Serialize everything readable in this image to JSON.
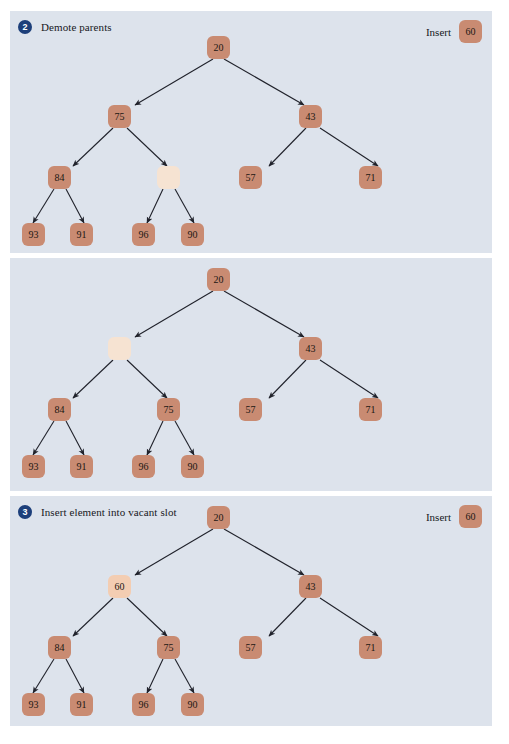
{
  "figure": {
    "type": "diagram",
    "node_color": "#c98b72",
    "vacant_node_color": "#f6e3d2",
    "inserted_node_color": "#f3cdb2",
    "panel_background": "#dde3ec",
    "badge_color": "#1d3f7a",
    "edge_color": "#20222b"
  },
  "panels": [
    {
      "step_number": "2",
      "title": "Demote parents",
      "insert_label": "Insert",
      "insert_value": "60",
      "has_header": true,
      "nodes": {
        "root": "20",
        "left": "75",
        "right": "43",
        "left_left": "84",
        "left_right": "",
        "right_left": "57",
        "right_right": "71",
        "leaf_1": "93",
        "leaf_2": "91",
        "leaf_3": "96",
        "leaf_4": "90"
      }
    },
    {
      "step_number": "",
      "title": "",
      "insert_label": "",
      "insert_value": "",
      "has_header": false,
      "nodes": {
        "root": "20",
        "left": "",
        "right": "43",
        "left_left": "84",
        "left_right": "75",
        "right_left": "57",
        "right_right": "71",
        "leaf_1": "93",
        "leaf_2": "91",
        "leaf_3": "96",
        "leaf_4": "90"
      }
    },
    {
      "step_number": "3",
      "title": "Insert element into vacant slot",
      "insert_label": "Insert",
      "insert_value": "60",
      "has_header": true,
      "nodes": {
        "root": "20",
        "left": "60",
        "right": "43",
        "left_left": "84",
        "left_right": "75",
        "right_left": "57",
        "right_right": "71",
        "leaf_1": "93",
        "leaf_2": "91",
        "leaf_3": "96",
        "leaf_4": "90"
      }
    }
  ]
}
